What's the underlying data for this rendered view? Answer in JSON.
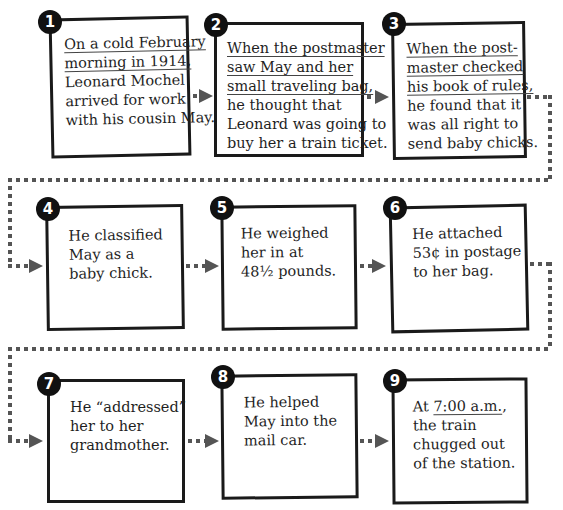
{
  "diagram": {
    "type": "sequence-flowchart",
    "steps": [
      {
        "number": "1",
        "lines": [
          {
            "text": "On a cold February",
            "underline": true
          },
          {
            "text": "morning in 1914,",
            "underline": true
          },
          {
            "text": "Leonard Mochel",
            "underline": false
          },
          {
            "text": "arrived for work",
            "underline": false
          },
          {
            "text": "with his cousin May.",
            "underline": false
          }
        ]
      },
      {
        "number": "2",
        "lines": [
          {
            "text": "When the postmaster",
            "underline": true
          },
          {
            "text": "saw May and her",
            "underline": true
          },
          {
            "text": "small traveling bag,",
            "underline": true
          },
          {
            "text": "he thought that",
            "underline": false
          },
          {
            "text": "Leonard was going to",
            "underline": false
          },
          {
            "text": "buy her a train ticket.",
            "underline": false
          }
        ]
      },
      {
        "number": "3",
        "lines": [
          {
            "text": "When the post-",
            "underline": true
          },
          {
            "text": "master checked",
            "underline": true
          },
          {
            "text": "his book of rules,",
            "underline": true
          },
          {
            "text": "he found that it",
            "underline": false
          },
          {
            "text": "was all right to",
            "underline": false
          },
          {
            "text": "send baby chicks.",
            "underline": false
          }
        ]
      },
      {
        "number": "4",
        "lines": [
          {
            "text": "He classified",
            "underline": false
          },
          {
            "text": "May as a",
            "underline": false
          },
          {
            "text": "baby chick.",
            "underline": false
          }
        ]
      },
      {
        "number": "5",
        "lines": [
          {
            "text": "He weighed",
            "underline": false
          },
          {
            "text": "her in at",
            "underline": false
          },
          {
            "text": "48½ pounds.",
            "underline": false
          }
        ]
      },
      {
        "number": "6",
        "lines": [
          {
            "text": "He attached",
            "underline": false
          },
          {
            "text": "53¢ in postage",
            "underline": false
          },
          {
            "text": "to her bag.",
            "underline": false
          }
        ]
      },
      {
        "number": "7",
        "lines": [
          {
            "text": "He “addressed”",
            "underline": false
          },
          {
            "text": "her to her",
            "underline": false
          },
          {
            "text": "grandmother.",
            "underline": false
          }
        ]
      },
      {
        "number": "8",
        "lines": [
          {
            "text": "He helped",
            "underline": false
          },
          {
            "text": "May into the",
            "underline": false
          },
          {
            "text": "mail car.",
            "underline": false
          }
        ]
      },
      {
        "number": "9",
        "lines": [
          {
            "text": "At 7:00 a.m.,",
            "underline": false,
            "underline_part": "7:00 a.m."
          },
          {
            "text": "the train",
            "underline": false
          },
          {
            "text": "chugged out",
            "underline": false
          },
          {
            "text": "of the station.",
            "underline": false
          }
        ]
      }
    ],
    "colors": {
      "box_border": "#1a1a1a",
      "badge_bg": "#111111",
      "connector": "#555555",
      "text": "#1f1f1f"
    }
  }
}
